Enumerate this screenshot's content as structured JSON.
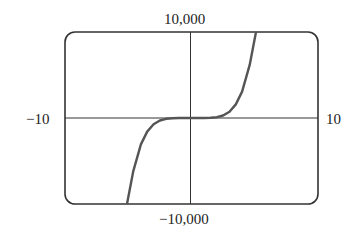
{
  "chart_data": {
    "type": "line",
    "title": "",
    "xlabel": "",
    "ylabel": "",
    "xlim": [
      -10,
      10
    ],
    "ylim": [
      -10000,
      10000
    ],
    "grid": false,
    "legend": null,
    "axis_labels": {
      "ymax": "10,000",
      "ymin": "−10,000",
      "xmin": "−10",
      "xmax": "10"
    },
    "series": [
      {
        "name": "curve",
        "x": [
          -5.1,
          -4.6,
          -4.0,
          -3.5,
          -3.0,
          -2.5,
          -2.0,
          -1.5,
          -1.0,
          0,
          1.0,
          1.5,
          2.0,
          2.5,
          3.0,
          3.5,
          4.0,
          4.6,
          5.1
        ],
        "y": [
          -10000,
          -6180,
          -3072,
          -1576,
          -729,
          -293,
          -96,
          -23,
          -3,
          0,
          3,
          23,
          96,
          293,
          729,
          1576,
          3072,
          6180,
          10000
        ]
      }
    ],
    "colors": {
      "frame": "#333333",
      "axes": "#333333",
      "curve": "#555555"
    }
  }
}
